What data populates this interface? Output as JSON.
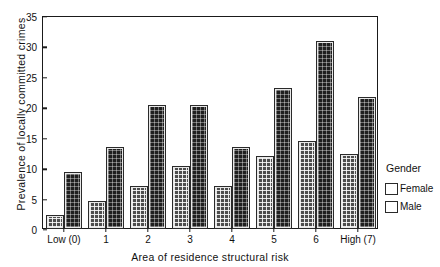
{
  "chart_data": {
    "type": "bar",
    "title": "",
    "xlabel": "Area of residence structural risk",
    "ylabel": "Prevalence of locally committed crimes",
    "categories": [
      "Low (0)",
      "1",
      "2",
      "3",
      "4",
      "5",
      "6",
      "High (7)"
    ],
    "series": [
      {
        "name": "Female",
        "values": [
          2.0,
          4.3,
          6.7,
          10.1,
          6.7,
          11.6,
          14.2,
          12.0
        ],
        "color": "#4d4d4d"
      },
      {
        "name": "Male",
        "values": [
          9.0,
          13.2,
          20.0,
          20.0,
          13.2,
          22.9,
          30.5,
          21.4
        ],
        "color": "#1f1f1f"
      }
    ],
    "ylim": [
      0,
      35
    ],
    "yticks": [
      0,
      5,
      10,
      15,
      20,
      25,
      30,
      35
    ],
    "ytick_labels": [
      "0",
      "5",
      "10",
      "15",
      "20",
      "25",
      "30",
      "35"
    ],
    "grid": false,
    "legend": {
      "title": "Gender",
      "position": "right",
      "entries": [
        "Female",
        "Male"
      ]
    }
  }
}
